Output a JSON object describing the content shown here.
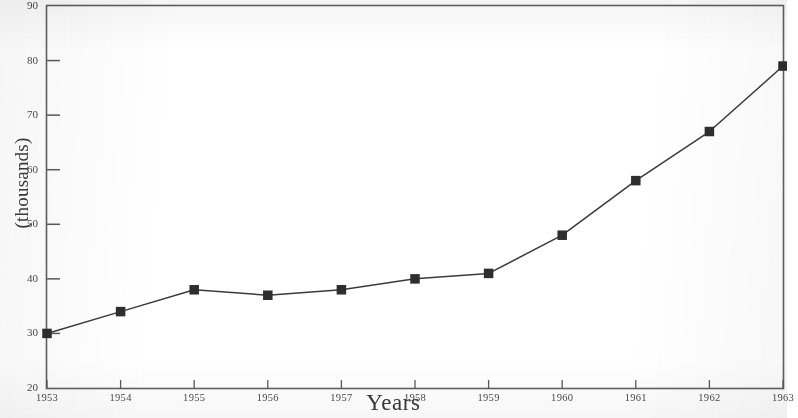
{
  "chart_data": {
    "type": "line",
    "title": "",
    "subtitle": "",
    "xlabel": "Years",
    "ylabel": "(thousands)",
    "categories": [
      "1953",
      "1954",
      "1955",
      "1956",
      "1957",
      "1958",
      "1959",
      "1960",
      "1961",
      "1962",
      "1963"
    ],
    "x": [
      1953,
      1954,
      1955,
      1956,
      1957,
      1958,
      1959,
      1960,
      1961,
      1962,
      1963
    ],
    "values": [
      30,
      34,
      38,
      37,
      38,
      40,
      41,
      48,
      58,
      67,
      79
    ],
    "series": [
      {
        "name": "",
        "values": [
          30,
          34,
          38,
          37,
          38,
          40,
          41,
          48,
          58,
          67,
          79
        ]
      }
    ],
    "ylim": [
      20,
      90
    ],
    "xlim": [
      1953,
      1963
    ],
    "yticks": [
      20,
      30,
      40,
      50,
      60,
      70,
      80,
      90
    ],
    "ytick_labels": [
      "20",
      "30",
      "40",
      "50",
      "60",
      "70",
      "80",
      "90"
    ],
    "xtick_labels": [
      "1953",
      "1954",
      "1955",
      "1956",
      "1957",
      "1958",
      "1959",
      "1960",
      "1961",
      "1962",
      "1963"
    ],
    "grid": false,
    "legend": null,
    "legend_position": "none",
    "marker": "filled-square",
    "line_color": "#3b3b3b",
    "marker_color": "#2e2e2e",
    "axis_color": "#555555",
    "background_color": "#ffffff",
    "annotations": []
  },
  "axis": {
    "y_title": "(thousands)",
    "x_title": "Years"
  }
}
